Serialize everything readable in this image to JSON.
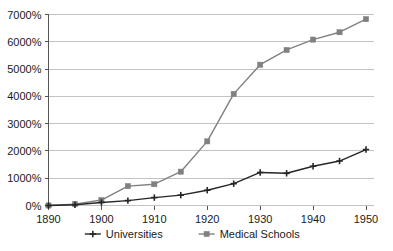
{
  "chart_data": {
    "type": "line",
    "title": "",
    "subtitle": "",
    "xlabel": "",
    "ylabel": "",
    "x": [
      1890,
      1895,
      1900,
      1905,
      1910,
      1915,
      1920,
      1925,
      1930,
      1935,
      1940,
      1945,
      1950
    ],
    "categories": [
      "1890",
      "1895",
      "1900",
      "1905",
      "1910",
      "1915",
      "1920",
      "1925",
      "1930",
      "1935",
      "1940",
      "1945",
      "1950"
    ],
    "xlim": [
      1890,
      1950
    ],
    "ylim": [
      0,
      7000
    ],
    "y_tick_values": [
      0,
      1000,
      2000,
      3000,
      4000,
      5000,
      6000,
      7000
    ],
    "y_tick_labels": [
      "0%",
      "1000%",
      "2000%",
      "3000%",
      "4000%",
      "5000%",
      "6000%",
      "7000%"
    ],
    "x_tick_values": [
      1890,
      1900,
      1910,
      1920,
      1930,
      1940,
      1950
    ],
    "x_tick_labels": [
      "1890",
      "1900",
      "1910",
      "1920",
      "1930",
      "1940",
      "1950"
    ],
    "grid": "horizontal",
    "legend_position": "bottom-center",
    "series": [
      {
        "name": "Universities",
        "color": "#262626",
        "marker": "plus",
        "values": [
          0,
          30,
          110,
          180,
          290,
          380,
          560,
          800,
          1210,
          1180,
          1440,
          1630,
          2050
        ]
      },
      {
        "name": "Medical Schools",
        "color": "#808080",
        "marker": "square",
        "values": [
          0,
          50,
          200,
          710,
          780,
          1240,
          2350,
          4090,
          5160,
          5700,
          6080,
          6350,
          6830
        ]
      }
    ]
  },
  "legend": {
    "items": [
      {
        "label": "Universities"
      },
      {
        "label": "Medical Schools"
      }
    ]
  }
}
